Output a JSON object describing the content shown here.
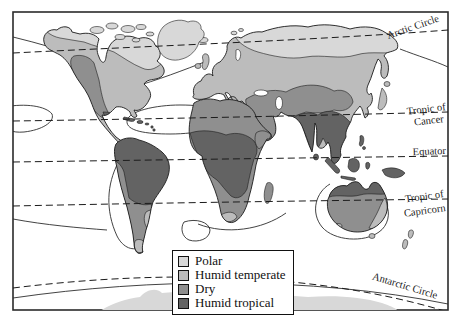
{
  "map": {
    "latitude_labels": {
      "arctic": "Arctic Circle",
      "cancer_line1": "Tropic of",
      "cancer_line2": "Cancer",
      "equator": "Equator",
      "capricorn_line1": "Tropic of",
      "capricorn_line2": "Capricorn",
      "antarctic": "Antarctic Circle"
    },
    "legend": {
      "items": [
        {
          "label": "Polar",
          "color": "#d8d8d8"
        },
        {
          "label": "Humid temperate",
          "color": "#bcbcbc"
        },
        {
          "label": "Dry",
          "color": "#8f8f8f"
        },
        {
          "label": "Humid tropical",
          "color": "#636363"
        }
      ]
    },
    "colors": {
      "ocean": "#ffffff",
      "outline": "#1c1c1c"
    }
  }
}
